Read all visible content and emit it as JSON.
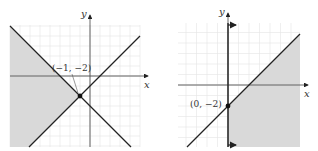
{
  "graphs": [
    {
      "id": "left",
      "x_label": "x",
      "y_label": "y",
      "boundary_lines": [
        {
          "equation": "y = x - 1",
          "slope": 1,
          "intercept": -1
        },
        {
          "equation": "y = -x - 3",
          "slope": -1,
          "intercept": -3
        }
      ],
      "shaded_region": "left of both lines (y > x - 1 and y < -x - 3)",
      "labeled_point": {
        "label": "(−1, −2)",
        "x": -1,
        "y": -2
      },
      "x_range": [
        -8,
        5
      ],
      "y_range": [
        -7,
        5
      ]
    },
    {
      "id": "right",
      "x_label": "x",
      "y_label": "y",
      "boundary_lines": [
        {
          "equation": "y = x - 2",
          "slope": 1,
          "intercept": -2
        },
        {
          "equation": "x = 0",
          "vertical": true
        }
      ],
      "shaded_region": "right of x = 0 and below y = x - 2",
      "labeled_point": {
        "label": "(0, −2)",
        "x": 0,
        "y": -2
      },
      "x_range": [
        -5,
        7
      ],
      "y_range": [
        -6,
        6
      ]
    }
  ],
  "colors": {
    "shade": "#d9d9d9",
    "line": "#222222",
    "grid": "#e4e4e4",
    "axis": "#444444"
  }
}
